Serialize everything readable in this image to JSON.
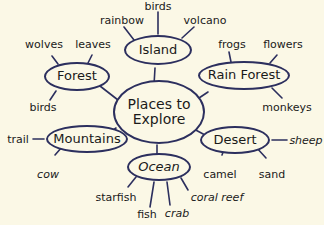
{
  "diagram": {
    "center": {
      "label_line1": "Places to",
      "label_line2": "Explore"
    },
    "colors": {
      "background": "#fbf8e6",
      "outline": "#2c2f5e",
      "text": "#1a1a1a"
    },
    "categories": [
      {
        "name": "Island",
        "items": [
          "birds",
          "rainbow",
          "volcano"
        ]
      },
      {
        "name": "Forest",
        "items": [
          "wolves",
          "leaves",
          "birds"
        ]
      },
      {
        "name": "Rain Forest",
        "items": [
          "frogs",
          "flowers",
          "monkeys"
        ]
      },
      {
        "name": "Mountains",
        "items": [
          "trail",
          "cow"
        ]
      },
      {
        "name": "Desert",
        "items": [
          "sheep",
          "camel",
          "sand"
        ]
      },
      {
        "name": "Ocean",
        "items": [
          "starfish",
          "fish",
          "crab",
          "coral reef"
        ]
      }
    ]
  }
}
